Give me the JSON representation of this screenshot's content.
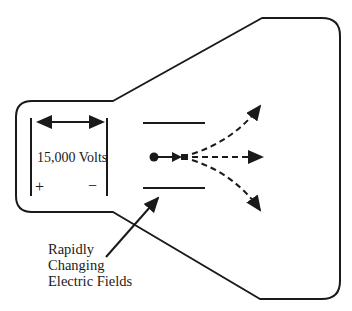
{
  "diagram": {
    "colors": {
      "stroke": "#1a1a1a",
      "background": "#ffffff"
    },
    "labels": {
      "voltage": "15,000 Volts",
      "positive": "+",
      "negative": "−",
      "caption_line1": "Rapidly",
      "caption_line2": "Changing",
      "caption_line3": "Electric Fields"
    },
    "elements": [
      "tube-outline",
      "accelerating-plates",
      "voltage-double-arrow",
      "electron-source-dot",
      "deflection-plate-top",
      "deflection-plate-bottom",
      "beam-path-up",
      "beam-path-straight",
      "beam-path-down",
      "caption-pointer-arrow"
    ]
  }
}
